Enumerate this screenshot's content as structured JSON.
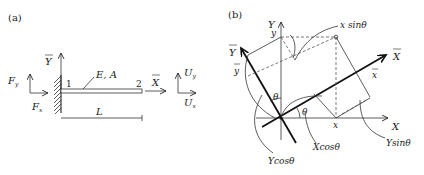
{
  "figure": {
    "panel_a": {
      "label": "(a)",
      "global_axis_y": "Y",
      "global_axis_x": "X",
      "force_y": "F",
      "force_y_sub": "y",
      "force_x": "F",
      "force_x_sub": "x",
      "node_1": "1",
      "node_2": "2",
      "material": "E, A",
      "length": "L",
      "disp_y": "U",
      "disp_y_sub": "y",
      "disp_x": "U",
      "disp_x_sub": "x"
    },
    "panel_b": {
      "label": "(b)",
      "axis_Y": "Y",
      "axis_X": "X",
      "axis_Ybar": "Y",
      "axis_Xbar": "X",
      "coord_y": "y",
      "coord_x": "x",
      "coord_ybar": "y",
      "coord_xbar": "x",
      "theta_1": "θ",
      "theta_2": "θ",
      "x_sin": "x sinθ",
      "X_cos": "Xcosθ",
      "Y_cos": "Ycosθ",
      "Y_sin": "Ysinθ"
    }
  }
}
